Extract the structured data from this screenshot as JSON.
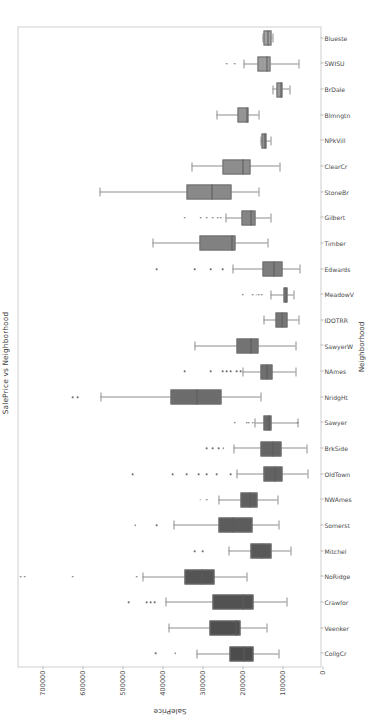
{
  "chart_data": {
    "type": "box",
    "title": "SalePrice vs Neighborhood",
    "xlabel": "Neighborhood",
    "ylabel": "SalePrice",
    "ylim": [
      0,
      760000
    ],
    "yticks": [
      0,
      100000,
      200000,
      300000,
      400000,
      500000,
      600000,
      700000
    ],
    "ytick_labels": [
      "0",
      "100000",
      "200000",
      "300000",
      "400000",
      "500000",
      "600000",
      "700000"
    ],
    "grid": false,
    "legend": null,
    "orientation": "vertical-boxes-rotated-page",
    "categories": [
      "CollgCr",
      "Veenker",
      "Crawfor",
      "NoRidge",
      "Mitchel",
      "Somerst",
      "NWAmes",
      "OldTown",
      "BrkSide",
      "Sawyer",
      "NridgHt",
      "NAmes",
      "SawyerW",
      "IDOTRR",
      "MeadowV",
      "Edwards",
      "Timber",
      "Gilbert",
      "StoneBr",
      "ClearCr",
      "NPkVill",
      "Blmngtn",
      "BrDale",
      "SWISU",
      "Blueste"
    ],
    "boxes": [
      {
        "category": "CollgCr",
        "whislo": 110000,
        "q1": 172500,
        "med": 197200,
        "q3": 233500,
        "whishi": 315000,
        "fliers": [
          368000,
          417500
        ]
      },
      {
        "category": "Veenker",
        "whislo": 139000,
        "q1": 204500,
        "med": 218000,
        "q3": 282500,
        "whishi": 385000,
        "fliers": []
      },
      {
        "category": "Crawfor",
        "whislo": 90350,
        "q1": 172000,
        "med": 200624,
        "q3": 275000,
        "whishi": 392500,
        "fliers": [
          420000,
          430000,
          440000,
          485000
        ]
      },
      {
        "category": "NoRidge",
        "whislo": 190000,
        "q1": 270000,
        "med": 301500,
        "q3": 345000,
        "whishi": 450000,
        "fliers": [
          465000,
          625000,
          745000,
          755000
        ]
      },
      {
        "category": "Mitchel",
        "whislo": 81000,
        "q1": 127500,
        "med": 153500,
        "q3": 180000,
        "whishi": 235000,
        "fliers": [
          300000,
          320000
        ]
      },
      {
        "category": "Somerst",
        "whislo": 110000,
        "q1": 176000,
        "med": 225500,
        "q3": 260000,
        "whishi": 372500,
        "fliers": [
          415000,
          468000
        ]
      },
      {
        "category": "NWAmes",
        "whislo": 112500,
        "q1": 161500,
        "med": 182900,
        "q3": 205000,
        "whishi": 260000,
        "fliers": [
          290000,
          306000
        ]
      },
      {
        "category": "OldTown",
        "whislo": 37900,
        "q1": 100000,
        "med": 119000,
        "q3": 148000,
        "whishi": 215000,
        "fliers": [
          230000,
          265000,
          290000,
          310000,
          340000,
          375000,
          475000
        ]
      },
      {
        "category": "BrkSide",
        "whislo": 39300,
        "q1": 102000,
        "med": 124300,
        "q3": 155000,
        "whishi": 223500,
        "fliers": [
          248000,
          260000,
          275000,
          290000
        ]
      },
      {
        "category": "Sawyer",
        "whislo": 62383,
        "q1": 127000,
        "med": 135000,
        "q3": 148000,
        "whishi": 170000,
        "fliers": [
          62383,
          175000,
          183900,
          190000,
          219500
        ]
      },
      {
        "category": "NridgHt",
        "whislo": 154000,
        "q1": 252000,
        "med": 315000,
        "q3": 380000,
        "whishi": 555000,
        "fliers": [
          611657,
          625000
        ]
      },
      {
        "category": "NAmes",
        "whislo": 68000,
        "q1": 125000,
        "med": 140000,
        "q3": 155000,
        "whishi": 200000,
        "fliers": [
          205000,
          215000,
          230000,
          240000,
          250000,
          280000,
          345000
        ]
      },
      {
        "category": "SawyerW",
        "whislo": 67500,
        "q1": 160000,
        "med": 179900,
        "q3": 215000,
        "whishi": 320000,
        "fliers": []
      },
      {
        "category": "IDOTRR",
        "whislo": 60000,
        "q1": 88000,
        "med": 103000,
        "q3": 118000,
        "whishi": 147000,
        "fliers": []
      },
      {
        "category": "MeadowV",
        "whislo": 73000,
        "q1": 88000,
        "med": 93000,
        "q3": 98000,
        "whishi": 129500,
        "fliers": [
          151400,
          160000,
          166000,
          175000,
          200000
        ]
      },
      {
        "category": "Edwards",
        "whislo": 58500,
        "q1": 100000,
        "med": 121750,
        "q3": 150000,
        "whishi": 225000,
        "fliers": [
          250000,
          280000,
          320000,
          415000
        ]
      },
      {
        "category": "Timber",
        "whislo": 137500,
        "q1": 217500,
        "med": 228475,
        "q3": 308000,
        "whishi": 425000,
        "fliers": []
      },
      {
        "category": "Gilbert",
        "whislo": 131000,
        "q1": 168000,
        "med": 181000,
        "q3": 202000,
        "whishi": 243000,
        "fliers": [
          255000,
          262000,
          275000,
          290000,
          305000,
          345000
        ]
      },
      {
        "category": "StoneBr",
        "whislo": 160000,
        "q1": 227500,
        "med": 278000,
        "q3": 340000,
        "whishi": 556581,
        "fliers": []
      },
      {
        "category": "ClearCr",
        "whislo": 107500,
        "q1": 180000,
        "med": 200250,
        "q3": 250000,
        "whishi": 328000,
        "fliers": []
      },
      {
        "category": "NPkVill",
        "whislo": 130000,
        "q1": 140000,
        "med": 146000,
        "q3": 151500,
        "whishi": 155000,
        "fliers": []
      },
      {
        "category": "Blmngtn",
        "whislo": 159895,
        "q1": 185000,
        "med": 191000,
        "q3": 212000,
        "whishi": 264561,
        "fliers": []
      },
      {
        "category": "BrDale",
        "whislo": 83000,
        "q1": 100000,
        "med": 106000,
        "q3": 116000,
        "whishi": 125500,
        "fliers": []
      },
      {
        "category": "SWISU",
        "whislo": 60000,
        "q1": 130000,
        "med": 139500,
        "q3": 162000,
        "whishi": 197000,
        "fliers": [
          220000,
          240000
        ]
      },
      {
        "category": "Blueste",
        "whislo": 124000,
        "q1": 128500,
        "med": 137500,
        "q3": 147000,
        "whishi": 151000,
        "fliers": []
      }
    ],
    "box_colors": [
      "#4c4c4c",
      "#4f4f4f",
      "#525252",
      "#555555",
      "#585858",
      "#5c5c5c",
      "#5f5f5f",
      "#626262",
      "#656565",
      "#696969",
      "#6c6c6c",
      "#6f6f6f",
      "#737373",
      "#767676",
      "#7a7a7a",
      "#7d7d7d",
      "#818181",
      "#858585",
      "#898989",
      "#8d8d8d",
      "#919191",
      "#959595",
      "#999999",
      "#9d9d9d",
      "#a1a1a1"
    ]
  }
}
